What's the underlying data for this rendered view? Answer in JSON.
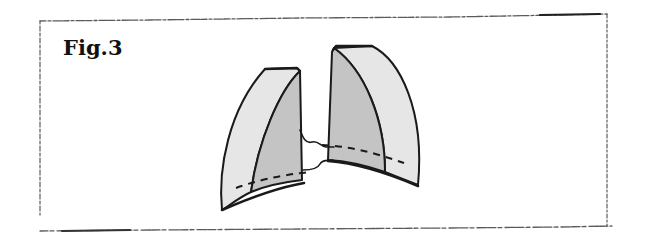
{
  "figure": {
    "label": "Fig.3"
  },
  "colors": {
    "outline": "#1a1a1a",
    "outer_face_fill": "#e6e6e6",
    "inner_face_fill": "#c4c4c4",
    "frame_stroke": "#555555",
    "background": "#ffffff"
  },
  "elements": {
    "left_panel": {
      "name": "left wedge panel"
    },
    "right_panel": {
      "name": "right wedge panel"
    },
    "connector": {
      "name": "connecting thread"
    },
    "dashed_lines": {
      "name": "fold/seam guide lines"
    }
  }
}
